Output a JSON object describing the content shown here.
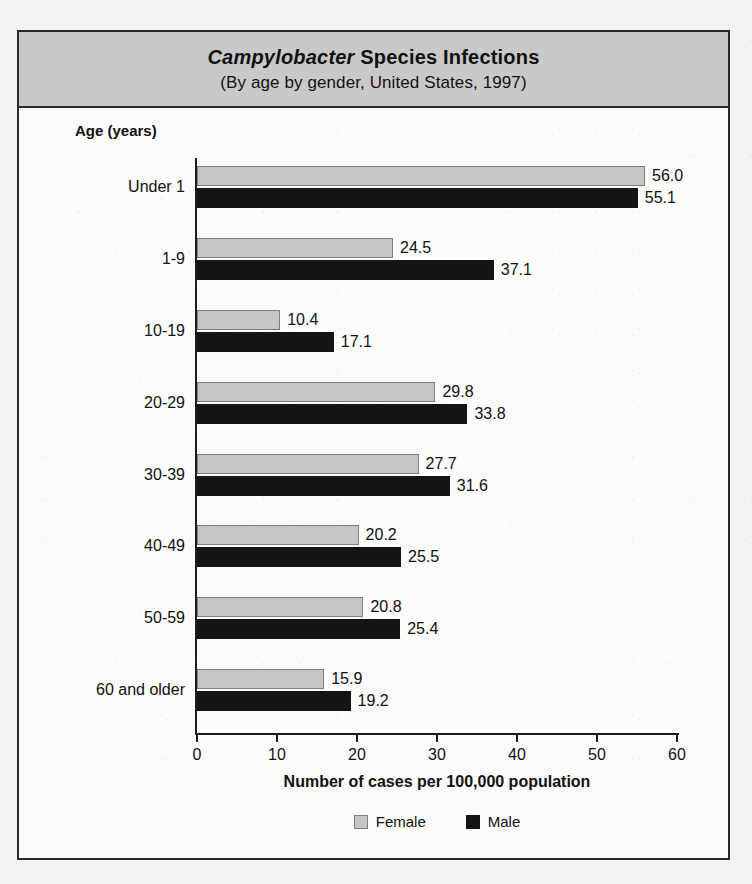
{
  "figure": {
    "title_prefix": "Campylobacter",
    "title_rest": " Species Infections",
    "subtitle": "(By age by gender, United States, 1997)",
    "axis_header": "Age (years)"
  },
  "legend": {
    "position": "bottom-center",
    "items": [
      {
        "label": "Female",
        "color": "#c6c6c6",
        "swatch": "female-swatch"
      },
      {
        "label": "Male",
        "color": "#141414",
        "swatch": "male-swatch"
      }
    ]
  },
  "chart_data": {
    "type": "bar",
    "orientation": "horizontal",
    "title": "Campylobacter Species Infections",
    "subtitle": "(By age by gender, United States, 1997)",
    "xlabel": "Number of cases per 100,000 population",
    "ylabel": "Age (years)",
    "xlim": [
      0,
      60
    ],
    "xticks": [
      0,
      10,
      20,
      30,
      40,
      50,
      60
    ],
    "grid": false,
    "legend_position": "bottom-center",
    "categories": [
      "Under 1",
      "1-9",
      "10-19",
      "20-29",
      "30-39",
      "40-49",
      "50-59",
      "60 and older"
    ],
    "series": [
      {
        "name": "Female",
        "color": "#c6c6c6",
        "values": [
          56.0,
          24.5,
          10.4,
          29.8,
          27.7,
          20.2,
          20.8,
          15.9
        ],
        "labels": [
          "56.0",
          "24.5",
          "10.4",
          "29.8",
          "27.7",
          "20.2",
          "20.8",
          "15.9"
        ]
      },
      {
        "name": "Male",
        "color": "#141414",
        "values": [
          55.1,
          37.1,
          17.1,
          33.8,
          31.6,
          25.5,
          25.4,
          19.2
        ],
        "labels": [
          "55.1",
          "37.1",
          "17.1",
          "33.8",
          "31.6",
          "25.5",
          "25.4",
          "19.2"
        ]
      }
    ]
  },
  "bleed_text": [
    "a report of cases from the surveillance",
    "incidence rate per 100,000 persons",
    "with data collected during 1997",
    "the number of laboratory confirmed",
    "cases reported to the state health",
    "Campylobacter jejuni remains among",
    "the most commonly isolated",
    "bacterial enteric pathogens",
    "surveillance network sites",
    "age and gender distribution"
  ]
}
